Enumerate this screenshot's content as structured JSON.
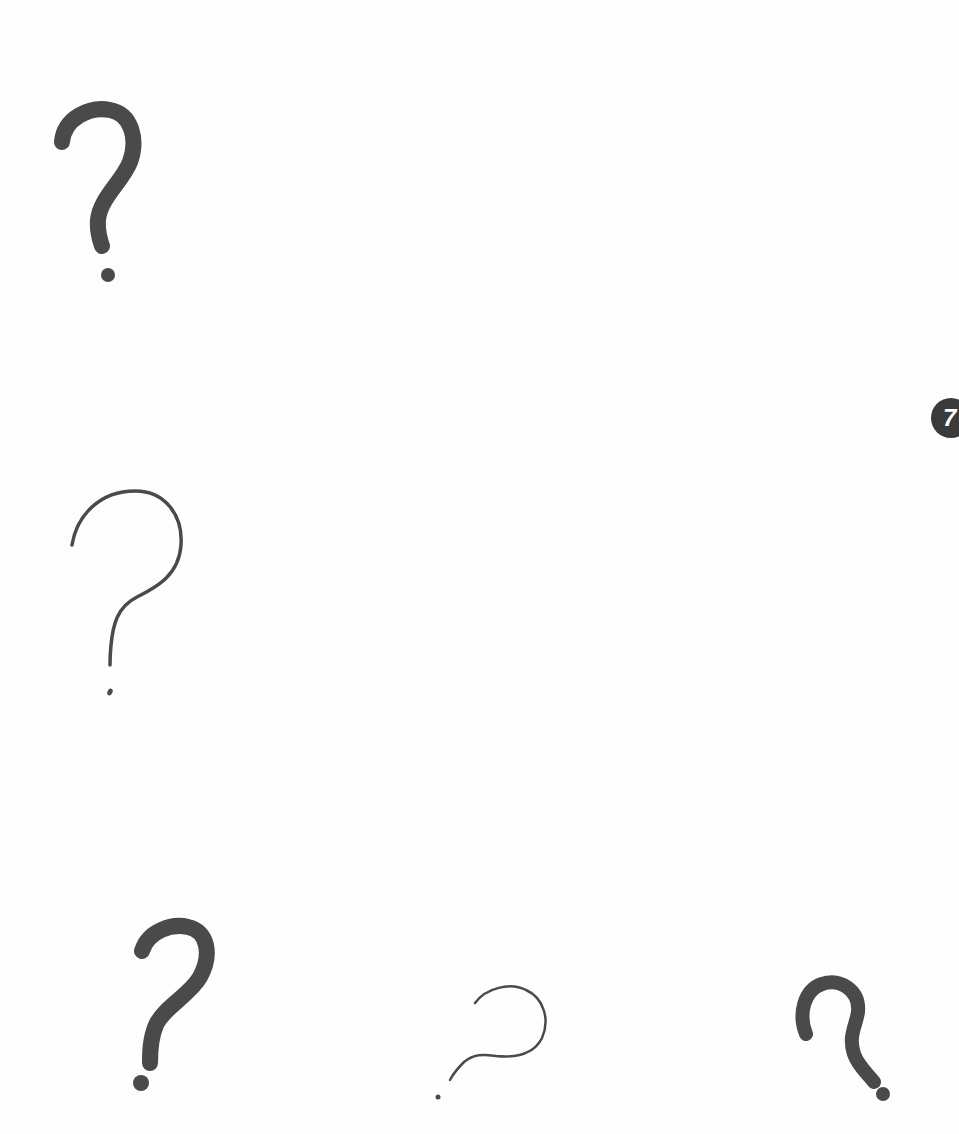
{
  "page": {
    "background": "#fefefe",
    "ink_color": "#4a4a4a"
  },
  "badge": {
    "number": "7",
    "background": "#3a3a3a",
    "text_color": "#ffffff"
  },
  "question_marks": [
    {
      "id": "qm-1",
      "style": "thick",
      "glyph": "?",
      "position": "top-left"
    },
    {
      "id": "qm-2",
      "style": "thin",
      "glyph": "?",
      "position": "middle-left"
    },
    {
      "id": "qm-3",
      "style": "thick",
      "glyph": "?",
      "position": "bottom-left"
    },
    {
      "id": "qm-4",
      "style": "thin-tilted",
      "glyph": "?",
      "position": "bottom-center"
    },
    {
      "id": "qm-5",
      "style": "thick-curly",
      "glyph": "?",
      "position": "bottom-right"
    }
  ]
}
